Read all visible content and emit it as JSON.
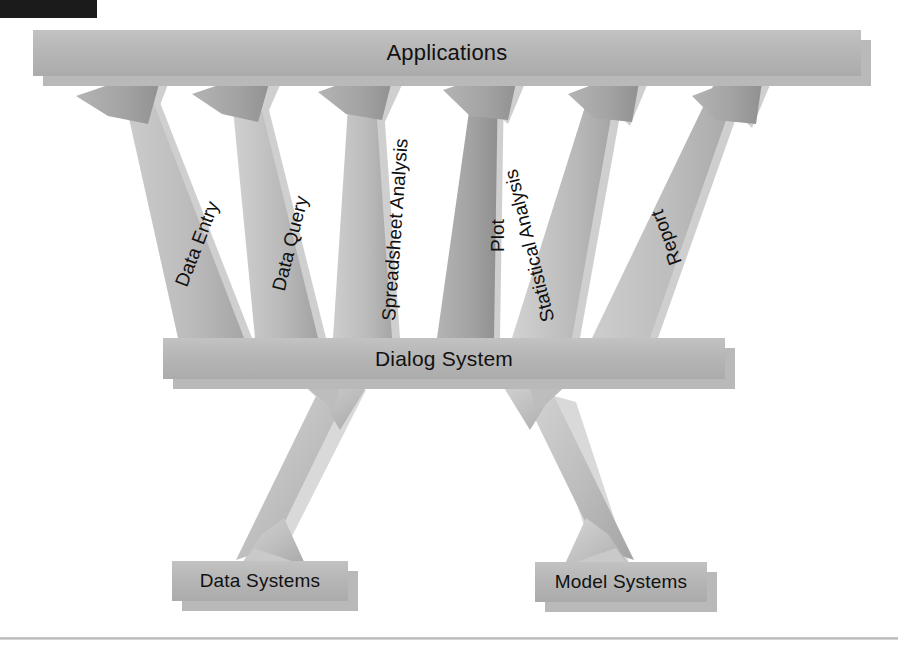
{
  "diagram": {
    "title_bar_present": true,
    "nodes": {
      "applications": {
        "label": "Applications"
      },
      "dialog_system": {
        "label": "Dialog System"
      },
      "data_systems": {
        "label": "Data Systems"
      },
      "model_systems": {
        "label": "Model Systems"
      }
    },
    "upward_arrow_labels": [
      {
        "id": "data-entry",
        "label": "Data Entry"
      },
      {
        "id": "data-query",
        "label": "Data Query"
      },
      {
        "id": "spreadsheet-analysis",
        "label": "Spreadsheet Analysis"
      },
      {
        "id": "plot",
        "label": "Plot"
      },
      {
        "id": "statistical-analysis",
        "label": "Statistical Analysis"
      },
      {
        "id": "report",
        "label": "Report"
      }
    ],
    "lower_connectors": [
      {
        "id": "dialog-to-data-systems",
        "label": ""
      },
      {
        "id": "dialog-to-model-systems",
        "label": ""
      }
    ],
    "colors": {
      "box_fill": "#b6b6b6",
      "box_shadow": "#b9b9b9",
      "arrow_fill_light": "#cfcfcf",
      "arrow_fill_mid": "#b3b3b3",
      "arrow_fill_dark": "#9a9a9a",
      "text": "#111111",
      "corner_tab": "#1b1b1b",
      "rule": "#c4c4c4",
      "page_background": "#ffffff"
    }
  }
}
